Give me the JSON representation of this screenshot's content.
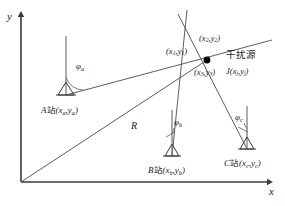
{
  "figure": {
    "type": "geometry-diagram",
    "axes": {
      "y_label": "y",
      "x_label": "x"
    },
    "stations": [
      {
        "id": "A",
        "label_prefix": "A",
        "label_cn": "站",
        "coord_open": "(",
        "coord_x": "x",
        "coord_x_sub": "a",
        "coord_sep": ",",
        "coord_y": "y",
        "coord_y_sub": "a",
        "coord_close": ")",
        "angle_symbol": "φ",
        "angle_sub": "a"
      },
      {
        "id": "B",
        "label_prefix": "B",
        "label_cn": "站",
        "coord_open": "(",
        "coord_x": "x",
        "coord_x_sub": "b",
        "coord_sep": ",",
        "coord_y": "y",
        "coord_y_sub": "b",
        "coord_close": ")",
        "angle_symbol": "φ",
        "angle_sub": "b"
      },
      {
        "id": "C",
        "label_prefix": "C",
        "label_cn": "站",
        "coord_open": "(",
        "coord_x": "x",
        "coord_x_sub": "c",
        "coord_sep": ",",
        "coord_y": "y",
        "coord_y_sub": "c",
        "coord_close": ")",
        "angle_symbol": "φ",
        "angle_sub": "c"
      }
    ],
    "intersection_points": [
      {
        "open": "(",
        "x": "x",
        "x_sub": "1",
        "sep": ",",
        "y": "y",
        "y_sub": "1",
        "close": ")"
      },
      {
        "open": "(",
        "x": "x",
        "x_sub": "2",
        "sep": ",",
        "y": "y",
        "y_sub": "2",
        "close": ")"
      },
      {
        "open": "(",
        "x": "x",
        "x_sub": "3",
        "sep": ",",
        "y": "y",
        "y_sub": "3",
        "close": ")"
      }
    ],
    "jamming_source": {
      "title_cn": "干扰源",
      "symbol": "J",
      "open": "(",
      "x": "x",
      "x_sub": "j",
      "sep": ",",
      "y": "y",
      "y_sub": "j",
      "close": ")"
    },
    "range_label": "R",
    "colors": {
      "line": "#3a3a3a",
      "text": "#1a1a1a",
      "marker": "#000000",
      "background": "#ffffff"
    }
  }
}
